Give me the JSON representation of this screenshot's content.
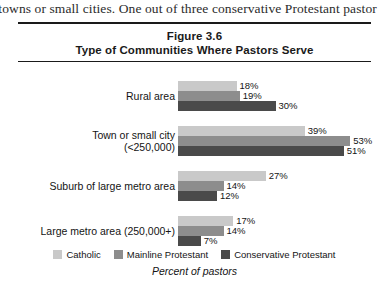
{
  "page": {
    "bleed_text": "l towns or small cities. One out of three conservative Protestant pastor"
  },
  "figure": {
    "title_line_1": "Figure 3.6",
    "title_line_2": "Type of Communities Where Pastors Serve",
    "axis_caption": "Percent of pastors"
  },
  "chart_data": {
    "type": "bar",
    "orientation": "horizontal",
    "title": "Type of Communities Where Pastors Serve",
    "subtitle": "Figure 3.6",
    "xlabel": "Percent of pastors",
    "ylabel": "",
    "xlim": [
      0,
      55
    ],
    "grid": false,
    "legend_position": "bottom",
    "value_suffix": "%",
    "categories": [
      "Rural area",
      "Town or small city (<250,000)",
      "Suburb of large metro area",
      "Large metro area (250,000+)"
    ],
    "category_lines": [
      [
        "Rural area"
      ],
      [
        "Town or small city",
        "(<250,000)"
      ],
      [
        "Suburb of large metro area"
      ],
      [
        "Large metro area (250,000+)"
      ]
    ],
    "series": [
      {
        "name": "Catholic",
        "color": "#c9c9c9",
        "values": [
          18,
          39,
          27,
          17
        ],
        "labels": [
          "18%",
          "39%",
          "27%",
          "17%"
        ]
      },
      {
        "name": "Mainline Protestant",
        "color": "#8d8d8d",
        "values": [
          19,
          53,
          14,
          14
        ],
        "labels": [
          "19%",
          "53%",
          "14%",
          "14%"
        ]
      },
      {
        "name": "Conservative Protestant",
        "color": "#4a4a4a",
        "values": [
          30,
          51,
          12,
          7
        ],
        "labels": [
          "30%",
          "51%",
          "12%",
          "7%"
        ]
      }
    ]
  }
}
